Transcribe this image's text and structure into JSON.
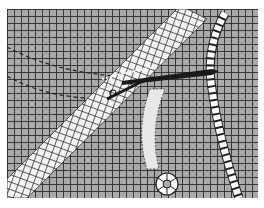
{
  "image": {
    "subject": "illustration of netting with ropes and a netting needle",
    "colors": {
      "background": "#ffffff",
      "mesh_fill": "#a9a9a9",
      "mesh_lines": "#2e2e2e",
      "rope": "#ffffff",
      "needle": "#1a1a1a"
    }
  }
}
